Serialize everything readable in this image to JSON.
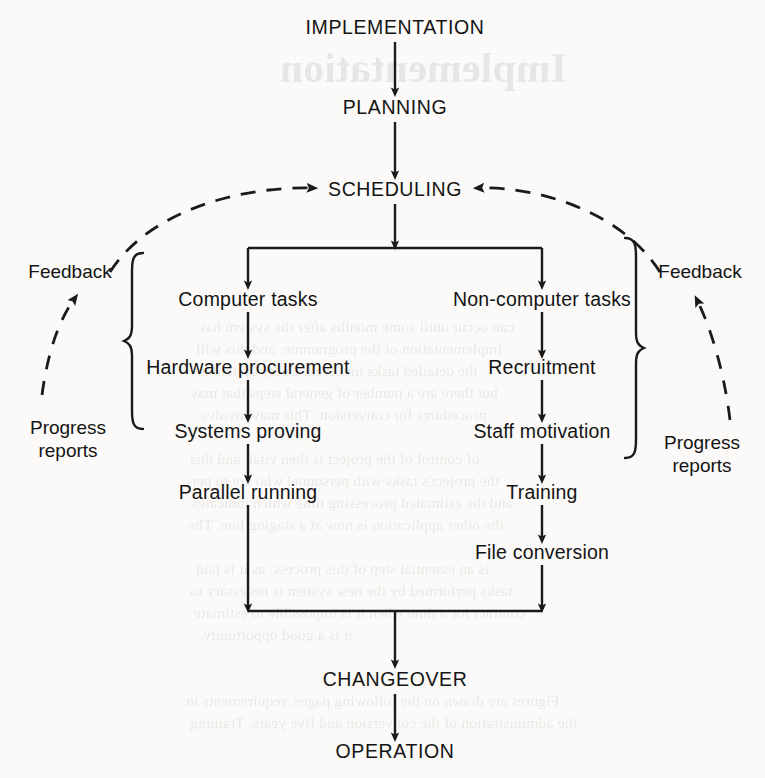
{
  "diagram": {
    "stroke_color": "#1a1a1a",
    "background_color": "#fbfaf8",
    "nodes": [
      {
        "id": "implementation",
        "label": "IMPLEMENTATION",
        "style": "caps",
        "x": 395,
        "y": 28
      },
      {
        "id": "planning",
        "label": "PLANNING",
        "style": "caps",
        "x": 395,
        "y": 108
      },
      {
        "id": "scheduling",
        "label": "SCHEDULING",
        "style": "caps",
        "x": 395,
        "y": 190
      },
      {
        "id": "computer-tasks",
        "label": "Computer tasks",
        "style": "mixed",
        "x": 248,
        "y": 300
      },
      {
        "id": "non-computer-tasks",
        "label": "Non-computer tasks",
        "style": "mixed",
        "x": 542,
        "y": 300
      },
      {
        "id": "hardware-procurement",
        "label": "Hardware procurement",
        "style": "mixed",
        "x": 248,
        "y": 368
      },
      {
        "id": "recruitment",
        "label": "Recruitment",
        "style": "mixed",
        "x": 542,
        "y": 368
      },
      {
        "id": "systems-proving",
        "label": "Systems proving",
        "style": "mixed",
        "x": 248,
        "y": 432
      },
      {
        "id": "staff-motivation",
        "label": "Staff motivation",
        "style": "mixed",
        "x": 542,
        "y": 432
      },
      {
        "id": "parallel-running",
        "label": "Parallel running",
        "style": "mixed",
        "x": 248,
        "y": 493
      },
      {
        "id": "training",
        "label": "Training",
        "style": "mixed",
        "x": 542,
        "y": 493
      },
      {
        "id": "file-conversion",
        "label": "File conversion",
        "style": "mixed",
        "x": 542,
        "y": 553
      },
      {
        "id": "changeover",
        "label": "CHANGEOVER",
        "style": "caps",
        "x": 395,
        "y": 680
      },
      {
        "id": "operation",
        "label": "OPERATION",
        "style": "caps",
        "x": 395,
        "y": 752
      }
    ],
    "side_labels": [
      {
        "id": "feedback-left",
        "label": "Feedback",
        "x": 70,
        "y": 272
      },
      {
        "id": "feedback-right",
        "label": "Feedback",
        "x": 700,
        "y": 272
      },
      {
        "id": "progress-reports-left",
        "line1": "Progress",
        "line2": "reports",
        "x": 68,
        "y": 440
      },
      {
        "id": "progress-reports-right",
        "line1": "Progress",
        "line2": "reports",
        "x": 702,
        "y": 455
      }
    ],
    "braces": [
      {
        "id": "brace-computer-tasks",
        "glyph": "{",
        "x": 134,
        "y": 432,
        "height": 178
      },
      {
        "id": "brace-non-computer-tasks",
        "glyph": "}",
        "x": 634,
        "y": 461,
        "height": 222
      }
    ],
    "edges": [
      {
        "id": "implementation-to-planning",
        "type": "straight-arrow"
      },
      {
        "id": "planning-to-scheduling",
        "type": "straight-arrow"
      },
      {
        "id": "scheduling-to-split",
        "type": "straight-arrow"
      },
      {
        "id": "split-bar",
        "type": "bus"
      },
      {
        "id": "split-to-computer-tasks",
        "type": "straight-arrow"
      },
      {
        "id": "split-to-non-computer-tasks",
        "type": "straight-arrow"
      },
      {
        "id": "computer-tasks-to-hardware",
        "type": "straight-arrow"
      },
      {
        "id": "hardware-to-systems-proving",
        "type": "straight-arrow"
      },
      {
        "id": "systems-proving-to-parallel",
        "type": "straight-arrow"
      },
      {
        "id": "non-computer-to-recruitment",
        "type": "straight-arrow"
      },
      {
        "id": "recruitment-to-staff",
        "type": "straight-arrow"
      },
      {
        "id": "staff-to-training",
        "type": "straight-arrow"
      },
      {
        "id": "training-to-file-conversion",
        "type": "straight-arrow"
      },
      {
        "id": "parallel-running-to-merge",
        "type": "straight-arrow"
      },
      {
        "id": "file-conversion-to-merge",
        "type": "straight-arrow"
      },
      {
        "id": "merge-bar",
        "type": "bus"
      },
      {
        "id": "merge-to-changeover",
        "type": "straight-arrow"
      },
      {
        "id": "changeover-to-operation",
        "type": "straight-arrow"
      },
      {
        "id": "feedback-left-arc",
        "type": "dashed-arc-arrow"
      },
      {
        "id": "feedback-right-arc",
        "type": "dashed-arc-arrow"
      },
      {
        "id": "progress-reports-left-arc",
        "type": "dashed-arc-arrow"
      },
      {
        "id": "progress-reports-right-arc",
        "type": "dashed-arc-arrow"
      }
    ]
  },
  "bleed_through": {
    "heading": "Implementation",
    "lines": [
      "can occur until some months after the system has",
      "implementation of the programme, and this will",
      "the detailed tasks involved. Every system is",
      "but there are a number of general steps that may",
      "procedures for conversion. This may involve",
      "of control of the project is then vital, and this",
      "the project's tasks with personnel who are to per-",
      "and the estimated processing time which indicates",
      "the other application is now at a staging line. The",
      "is an essential step of this process, as it is laid",
      "tasks performed by the new system is necessary to",
      "contract for a time when it is impossible to estimate",
      "it is a good opportunity.",
      "Figures are drawn on the following pages. requirements in",
      "the administration of the conversion and five years. Training"
    ]
  }
}
